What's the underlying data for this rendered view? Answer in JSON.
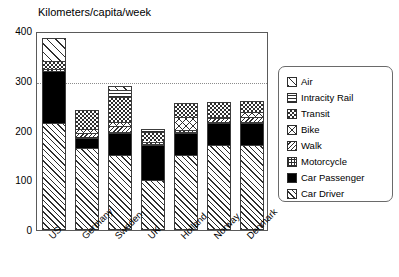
{
  "chart_data": {
    "type": "bar",
    "stacked": true,
    "title": "Kilometers/capita/week",
    "xlabel": "",
    "ylabel": "",
    "ylim": [
      0,
      400
    ],
    "yticks": [
      0,
      100,
      200,
      300,
      400
    ],
    "grid": "dotted horizontal gridline at 300",
    "gridlines": [
      300
    ],
    "legend_position": "right",
    "categories": [
      "US",
      "Germany",
      "Sweden",
      "UK",
      "Holland",
      "Norway",
      "Denmark"
    ],
    "series": [
      {
        "name": "Car Driver",
        "pattern": "diagonal-hatch-narrow",
        "values": [
          215,
          165,
          150,
          100,
          150,
          170,
          170
        ]
      },
      {
        "name": "Car Passenger",
        "pattern": "solid-black",
        "values": [
          105,
          20,
          45,
          70,
          45,
          45,
          45
        ]
      },
      {
        "name": "Motorcycle",
        "pattern": "fine-grid",
        "values": [
          0,
          2,
          3,
          2,
          2,
          2,
          2
        ]
      },
      {
        "name": "Walk",
        "pattern": "diagonal-hatch-wide",
        "values": [
          3,
          8,
          12,
          5,
          5,
          8,
          10
        ]
      },
      {
        "name": "Bike",
        "pattern": "cross-hatch",
        "values": [
          0,
          8,
          8,
          2,
          25,
          3,
          10
        ]
      },
      {
        "name": "Transit",
        "pattern": "checkerboard",
        "values": [
          17,
          38,
          50,
          18,
          28,
          30,
          22
        ]
      },
      {
        "name": "Intracity Rail",
        "pattern": "horizontal-lines",
        "values": [
          0,
          0,
          14,
          6,
          0,
          0,
          0
        ]
      },
      {
        "name": "Air",
        "pattern": "diagonal-hatch-sparse",
        "values": [
          45,
          0,
          8,
          0,
          0,
          0,
          0
        ]
      }
    ],
    "totals": [
      385,
      241,
      290,
      203,
      255,
      258,
      259
    ]
  },
  "legend": {
    "items": [
      {
        "label": "Air",
        "series": "Air"
      },
      {
        "label": "Intracity Rail",
        "series": "Intracity Rail"
      },
      {
        "label": "Transit",
        "series": "Transit"
      },
      {
        "label": "Bike",
        "series": "Bike"
      },
      {
        "label": "Walk",
        "series": "Walk"
      },
      {
        "label": "Motorcycle",
        "series": "Motorcycle"
      },
      {
        "label": "Car Passenger",
        "series": "Car Passenger"
      },
      {
        "label": "Car Driver",
        "series": "Car Driver"
      }
    ]
  },
  "colors": {
    "ink": "#2e2e2e",
    "frame": "#5a5a5a",
    "grid": "#8c8c8c",
    "background": "#ffffff"
  }
}
